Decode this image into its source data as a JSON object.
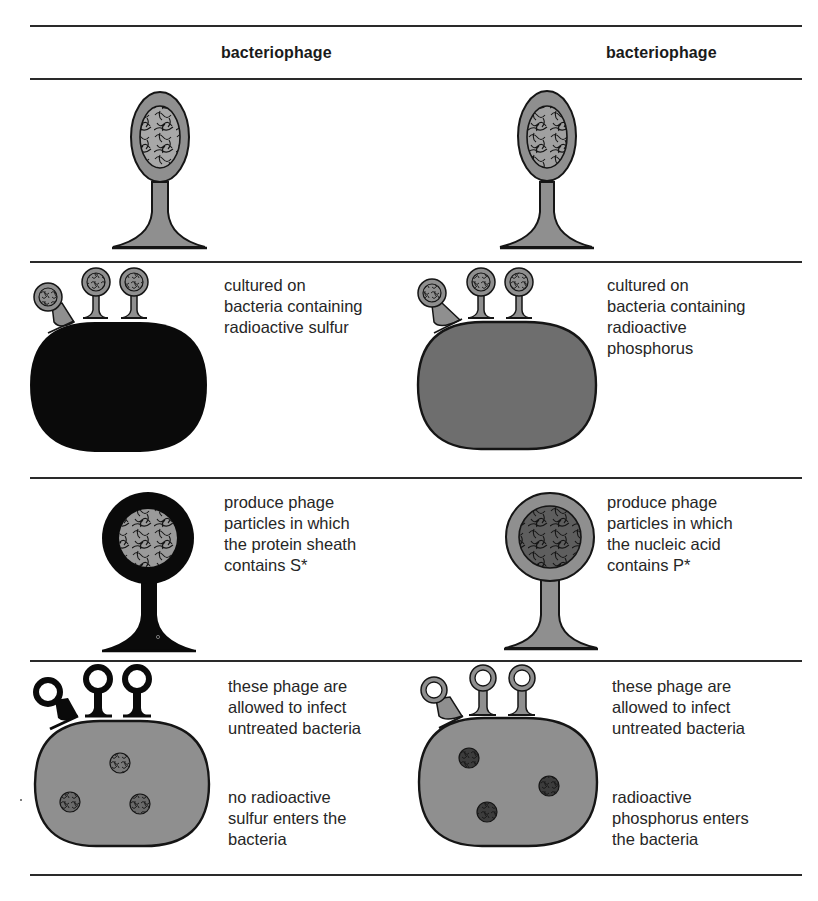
{
  "columns": [
    {
      "header": "bacteriophage",
      "experiment": "sulfur"
    },
    {
      "header": "bacteriophage",
      "experiment": "phosphorus"
    }
  ],
  "rows": [
    {
      "step": "phage",
      "left": {
        "text": ""
      },
      "right": {
        "text": ""
      }
    },
    {
      "step": "culture",
      "left": {
        "text": "cultured on\nbacteria containing\nradioactive sulfur"
      },
      "right": {
        "text": "cultured on\nbacteria containing\nradioactive\nphosphorus"
      }
    },
    {
      "step": "produce",
      "left": {
        "text": "produce phage\nparticles in which\nthe protein sheath\ncontains S*"
      },
      "right": {
        "text": "produce phage\nparticles in which\nthe nucleic acid\ncontains P*"
      }
    },
    {
      "step": "infect",
      "left": {
        "text_top": "these phage are\nallowed to infect\nuntreated bacteria",
        "text_bottom": "no radioactive\nsulfur enters the\nbacteria"
      },
      "right": {
        "text_top": "these phage are\nallowed to infect\nuntreated bacteria",
        "text_bottom": "radioactive\nphosphorus enters\nthe bacteria"
      }
    }
  ],
  "colors": {
    "gray_fill": "#8f8f8f",
    "dark_fill": "#0a0a0a",
    "outline": "#151515",
    "rule": "#2a2a2a"
  }
}
